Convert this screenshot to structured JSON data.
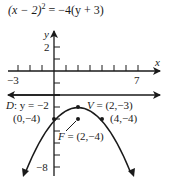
{
  "title": {
    "equation": "(x−2)² = −4(y+3)",
    "lhs": "(x − 2)",
    "exp": "2",
    "rhs": " = −4(y + 3)"
  },
  "axes": {
    "x_label": "x",
    "y_label": "y",
    "x_ticks": [
      -3,
      -2,
      -1,
      1,
      2,
      3,
      4,
      5,
      6,
      7
    ],
    "x_tick_labels": {
      "left": "−3",
      "right": "7"
    },
    "y_ticks": [
      2,
      1,
      -1,
      -2,
      -3,
      -4,
      -5,
      -6,
      -7,
      -8
    ],
    "y_tick_labels": {
      "top": "2",
      "bottom": "−8"
    }
  },
  "directrix": {
    "label": "D: y = −2",
    "prefix": "D",
    "text": ": y = −2",
    "y": -2
  },
  "vertex": {
    "label": "V = (2,−3)",
    "prefix": "V",
    "text": " = (2,−3)",
    "x": 2,
    "y": -3
  },
  "focus": {
    "label": "F = (2,−4)",
    "prefix": "F",
    "text": " = (2,−4)",
    "x": 2,
    "y": -4
  },
  "points": [
    {
      "label": "(0,−4)",
      "x": 0,
      "y": -4
    },
    {
      "label": "(4,−4)",
      "x": 4,
      "y": -4
    }
  ],
  "colors": {
    "ink": "#1a1a1a",
    "background": "#ffffff"
  }
}
